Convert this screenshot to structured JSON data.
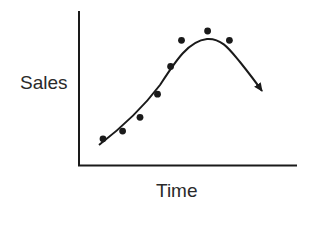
{
  "chart_data": {
    "type": "scatter",
    "title": "",
    "xlabel": "Time",
    "ylabel": "Sales",
    "x_ticks": [],
    "y_ticks": [],
    "grid": false,
    "legend": null,
    "xlim": [
      0,
      10
    ],
    "ylim": [
      0,
      10
    ],
    "series": [
      {
        "name": "observed sales",
        "kind": "points",
        "x": [
          1.1,
          2.0,
          2.8,
          3.6,
          4.2,
          4.7,
          5.9,
          6.9
        ],
        "y": [
          1.7,
          2.2,
          3.1,
          4.6,
          6.4,
          8.1,
          8.7,
          8.1
        ]
      },
      {
        "name": "trend curve",
        "kind": "line-with-arrow",
        "description": "Smooth S-rise to a peak then decline, ending in an arrowhead (product life cycle)",
        "x": [
          0.9,
          2.5,
          4.2,
          5.9,
          7.4,
          8.5
        ],
        "y": [
          1.3,
          3.0,
          5.9,
          8.2,
          6.5,
          4.8
        ]
      }
    ]
  },
  "colors": {
    "ink": "#1a1a1a",
    "background": "#ffffff"
  }
}
